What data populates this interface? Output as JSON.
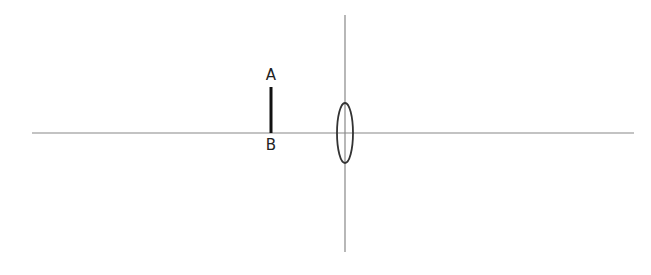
{
  "diagram": {
    "type": "optics-convex-lens",
    "colors": {
      "background": "#ffffff",
      "axis": "#888888",
      "lens": "#333333",
      "object": "#111111",
      "text": "#222222"
    },
    "principal_axis": {
      "x1": 32,
      "x2": 634,
      "y": 133
    },
    "lens_plane": {
      "x": 345,
      "y1": 15,
      "y2": 252
    },
    "lens": {
      "cx": 345,
      "cy": 133,
      "rx": 8,
      "ry": 30
    },
    "object": {
      "x": 271,
      "top_y": 87,
      "bottom_y": 133,
      "top_label": "A",
      "bottom_label": "B"
    }
  }
}
